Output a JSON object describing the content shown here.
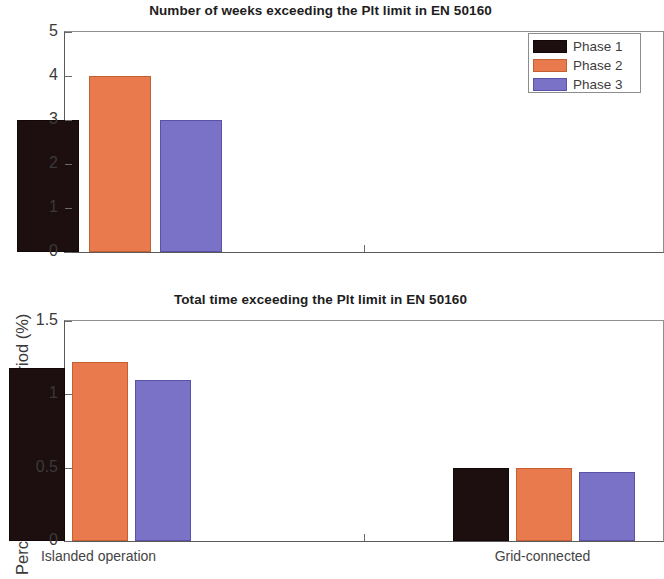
{
  "colors": {
    "phase1": "#1d0f10",
    "phase2": "#e87a4d",
    "phase3": "#7a72c6",
    "axis": "#5a5a5a",
    "background": "#ffffff"
  },
  "legend": {
    "position": "top-right",
    "entries": [
      {
        "label": "Phase 1",
        "color": "#1d0f10"
      },
      {
        "label": "Phase 2",
        "color": "#e87a4d"
      },
      {
        "label": "Phase 3",
        "color": "#7a72c6"
      }
    ]
  },
  "chart_data": [
    {
      "id": "weeks",
      "type": "bar",
      "title": "Number of weeks exceeding the Plt limit in EN 50160",
      "xlabel": "",
      "ylabel": "Weeks",
      "categories": [
        "Islanded operation",
        "Grid-connected"
      ],
      "series": [
        {
          "name": "Phase 1",
          "color": "#1d0f10",
          "values": [
            3,
            0
          ]
        },
        {
          "name": "Phase 2",
          "color": "#e87a4d",
          "values": [
            4,
            0
          ]
        },
        {
          "name": "Phase 3",
          "color": "#7a72c6",
          "values": [
            3,
            0
          ]
        }
      ],
      "ylim": [
        0,
        5
      ],
      "yticks": [
        0,
        1,
        2,
        3,
        4,
        5
      ],
      "ytick_labels": [
        "0",
        "1",
        "2",
        "3",
        "4",
        "5"
      ],
      "grid": false,
      "legend": true
    },
    {
      "id": "total-time",
      "type": "bar",
      "title": "Total time exceeding the Plt limit in EN 50160",
      "xlabel": "",
      "ylabel": "Percent of measurement period (%)",
      "categories": [
        "Islanded operation",
        "Grid-connected"
      ],
      "series": [
        {
          "name": "Phase 1",
          "color": "#1d0f10",
          "values": [
            1.18,
            0.5
          ]
        },
        {
          "name": "Phase 2",
          "color": "#e87a4d",
          "values": [
            1.22,
            0.5
          ]
        },
        {
          "name": "Phase 3",
          "color": "#7a72c6",
          "values": [
            1.1,
            0.47
          ]
        }
      ],
      "ylim": [
        0,
        1.5
      ],
      "yticks": [
        0,
        0.5,
        1,
        1.5
      ],
      "ytick_labels": [
        "0",
        "0.5",
        "1",
        "1.5"
      ],
      "grid": false,
      "legend": false
    }
  ]
}
